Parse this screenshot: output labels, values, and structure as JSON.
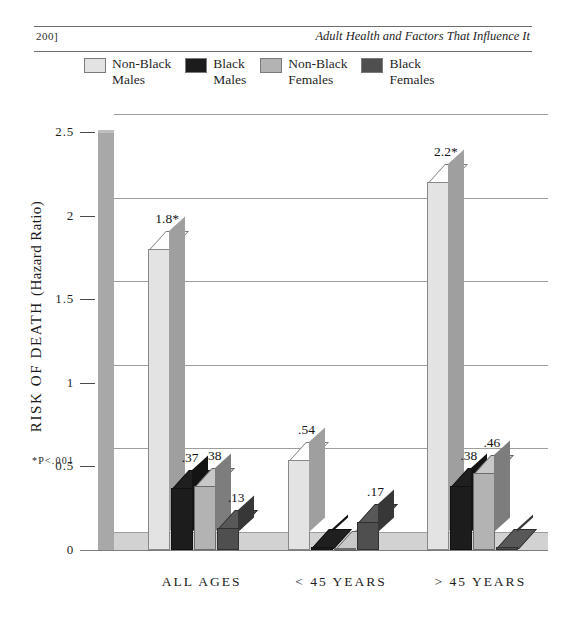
{
  "page": {
    "folio": "200]",
    "running_title": "Adult Health and Factors That Influence It"
  },
  "legend": {
    "items": [
      {
        "label_line1": "Non-Black",
        "label_line2": "Males",
        "color": "#e3e3e3",
        "name": "non-black-males"
      },
      {
        "label_line1": "Black",
        "label_line2": "Males",
        "color": "#1c1c1c",
        "name": "black-males"
      },
      {
        "label_line1": "Non-Black",
        "label_line2": "Females",
        "color": "#b3b3b3",
        "name": "non-black-females"
      },
      {
        "label_line1": "Black",
        "label_line2": "Females",
        "color": "#4f4f4f",
        "name": "black-females"
      }
    ]
  },
  "footnote": "*P<.001",
  "chart_data": {
    "type": "bar",
    "title": "",
    "xlabel": "",
    "ylabel": "RISK OF DEATH (Hazard Ratio)",
    "ylim": [
      0,
      2.5
    ],
    "yticks": [
      0,
      0.5,
      1,
      1.5,
      2,
      2.5
    ],
    "ytick_labels": [
      "0",
      "0.5",
      "1",
      "1.5",
      "2",
      "2.5"
    ],
    "grid": true,
    "legend_position": "top",
    "categories": [
      "ALL AGES",
      "< 45 YEARS",
      "> 45 YEARS"
    ],
    "series": [
      {
        "name": "Non-Black Males",
        "color": "#e3e3e3",
        "values": [
          1.8,
          0.54,
          2.2
        ],
        "labels": [
          "1.8*",
          ".54",
          "2.2*"
        ]
      },
      {
        "name": "Black Males",
        "color": "#1c1c1c",
        "values": [
          0.37,
          0.02,
          0.38
        ],
        "labels": [
          ".37",
          "",
          ".38"
        ]
      },
      {
        "name": "Non-Black Females",
        "color": "#b3b3b3",
        "values": [
          0.38,
          0.0,
          0.46
        ],
        "labels": [
          ".38",
          "",
          ".46"
        ]
      },
      {
        "name": "Black Females",
        "color": "#4f4f4f",
        "values": [
          0.13,
          0.17,
          0.02
        ],
        "labels": [
          ".13",
          ".17",
          ""
        ]
      }
    ]
  }
}
